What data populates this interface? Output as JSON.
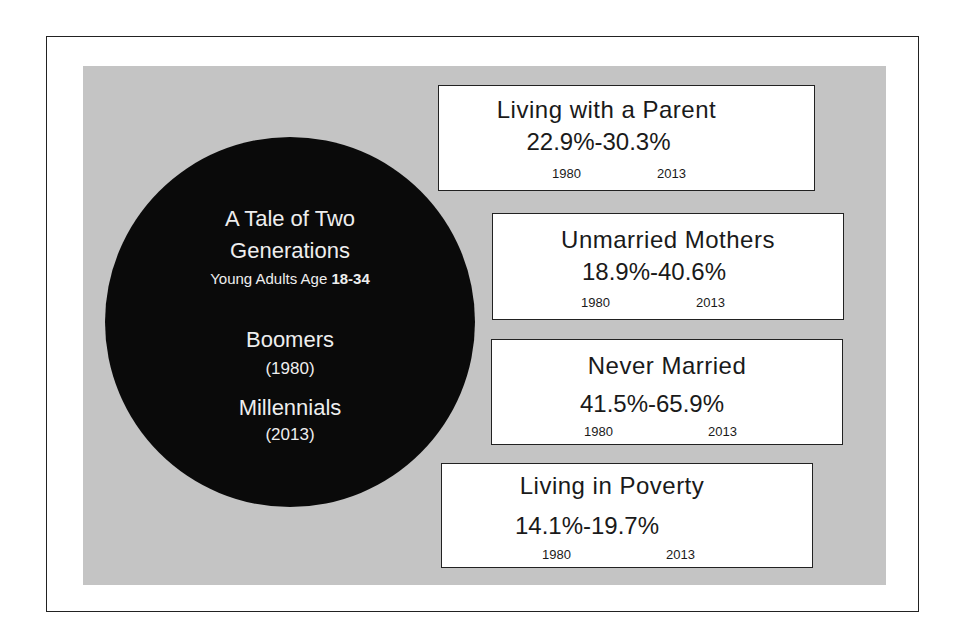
{
  "circle": {
    "title_line1": "A Tale of Two",
    "title_line2": "Generations",
    "subtitle": "Young Adults Age",
    "age_range": "18-34",
    "gen1_name": "Boomers",
    "gen1_year": "(1980)",
    "gen2_name": "Millennials",
    "gen2_year": "(2013)"
  },
  "stats": [
    {
      "label": "Living with a Parent",
      "value": "22.9%-30.3%",
      "year_from": "1980",
      "year_to": "2013"
    },
    {
      "label": "Unmarried Mothers",
      "value": "18.9%-40.6%",
      "year_from": "1980",
      "year_to": "2013"
    },
    {
      "label": "Never Married",
      "value": "41.5%-65.9%",
      "year_from": "1980",
      "year_to": "2013"
    },
    {
      "label": "Living in Poverty",
      "value": "14.1%-19.7%",
      "year_from": "1980",
      "year_to": "2013"
    }
  ],
  "colors": {
    "circle": "#0a0a0a",
    "panel": "#c4c4c4",
    "box": "#ffffff"
  }
}
